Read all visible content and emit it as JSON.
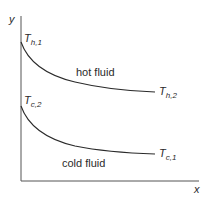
{
  "diagram": {
    "axes": {
      "x_label": "x",
      "y_label": "y",
      "color": "#555555"
    },
    "hot_curve": {
      "region_label": "hot fluid",
      "start_label": {
        "main": "T",
        "sub": "h,1"
      },
      "end_label": {
        "main": "T",
        "sub": "h,2"
      },
      "color": "#2a2a2a"
    },
    "cold_curve": {
      "region_label": "cold fluid",
      "start_label": {
        "main": "T",
        "sub": "c,2"
      },
      "end_label": {
        "main": "T",
        "sub": "c,1"
      },
      "color": "#2a2a2a"
    }
  }
}
